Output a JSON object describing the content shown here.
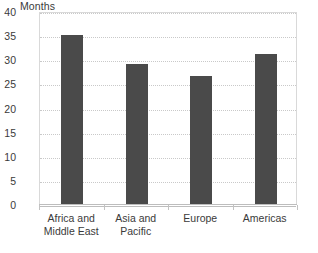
{
  "chart_data": {
    "type": "bar",
    "title": "",
    "subtitle": "",
    "xlabel": "",
    "ylabel": "Months",
    "categories": [
      "Africa and Middle East",
      "Asia and Pacific",
      "Europe",
      "Americas"
    ],
    "category_lines": [
      [
        "Africa and",
        "Middle East"
      ],
      [
        "Asia and",
        "Pacific"
      ],
      [
        "Europe",
        ""
      ],
      [
        "Americas",
        ""
      ]
    ],
    "values": [
      35,
      29,
      26.5,
      31
    ],
    "ylim": [
      0,
      40
    ],
    "ytick_step": 5,
    "ytick_labels": [
      "40",
      "35",
      "30",
      "25",
      "20",
      "15",
      "10",
      "5",
      "0"
    ],
    "ytick_values": [
      40,
      35,
      30,
      25,
      20,
      15,
      10,
      5,
      0
    ],
    "grid": true,
    "grid_axis": "y",
    "legend": null,
    "legend_position": "none",
    "colors": {
      "bar": "#4a4a4a",
      "gridline": "#c9c9c9",
      "axis": "#bdbdbd",
      "frame": "#d9d9d9",
      "text": "#3a3a3a",
      "background": "#ffffff"
    }
  }
}
